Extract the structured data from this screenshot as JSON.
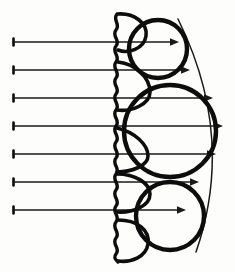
{
  "figure": {
    "background_color": "#fdfdfc",
    "ink_color": "#0d0d0d",
    "ray_color": "#1a1a1a",
    "canvas": {
      "width": 235,
      "height": 272
    }
  },
  "chart_data": {
    "type": "diagram",
    "xlabel": "",
    "ylabel": "",
    "xlim": [
      0,
      235
    ],
    "ylim": [
      0,
      272
    ],
    "grid": false,
    "legend": "none"
  },
  "rays": {
    "count": 7,
    "direction": "left-to-right",
    "start_x": 13,
    "items": [
      {
        "label": "ray-1",
        "y": 42,
        "x1": 13,
        "x2": 179
      },
      {
        "label": "ray-2",
        "y": 70,
        "x1": 13,
        "x2": 190
      },
      {
        "label": "ray-3",
        "y": 98,
        "x1": 13,
        "x2": 213
      },
      {
        "label": "ray-4",
        "y": 126,
        "x1": 13,
        "x2": 223
      },
      {
        "label": "ray-5",
        "y": 154,
        "x1": 13,
        "x2": 216
      },
      {
        "label": "ray-6",
        "y": 182,
        "x1": 13,
        "x2": 199
      },
      {
        "label": "ray-7",
        "y": 210,
        "x1": 13,
        "x2": 186
      }
    ]
  },
  "membrane": {
    "label": "wavy-vertical-membrane",
    "x_center": 117,
    "y_top": 14,
    "y_bottom": 262,
    "wave_amplitude": 4,
    "wave_period": 13
  },
  "lobes": [
    {
      "label": "lobe-top",
      "cx": 131,
      "cy": 32,
      "rx": 16,
      "ry": 19
    },
    {
      "label": "lobe-upper",
      "cx": 133,
      "cy": 86,
      "rx": 17,
      "ry": 24
    },
    {
      "label": "lobe-middle",
      "cx": 131,
      "cy": 150,
      "rx": 15,
      "ry": 22
    },
    {
      "label": "lobe-lower",
      "cx": 133,
      "cy": 192,
      "rx": 17,
      "ry": 20
    },
    {
      "label": "lobe-bottom",
      "cx": 132,
      "cy": 240,
      "rx": 16,
      "ry": 21
    }
  ],
  "circles": [
    {
      "label": "circle-top",
      "cx": 158,
      "cy": 49,
      "r": 29
    },
    {
      "label": "circle-middle",
      "cx": 170,
      "cy": 131,
      "r": 46
    },
    {
      "label": "circle-bottom",
      "cx": 170,
      "cy": 216,
      "r": 34
    }
  ],
  "envelope": {
    "label": "right-envelope-curve",
    "start": {
      "x": 178,
      "y": 19
    },
    "end": {
      "x": 196,
      "y": 252
    },
    "control": {
      "x": 236,
      "y": 136
    }
  }
}
